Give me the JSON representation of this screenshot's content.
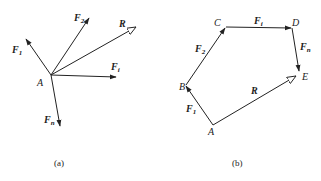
{
  "panel_a": {
    "caption": "(a)",
    "origin_label": "A",
    "vectors": [
      {
        "name": "F",
        "sub": "1",
        "arrow": "solid"
      },
      {
        "name": "F",
        "sub": "2",
        "arrow": "solid"
      },
      {
        "name": "R",
        "sub": "",
        "arrow": "hollow"
      },
      {
        "name": "F",
        "sub": "i",
        "arrow": "solid"
      },
      {
        "name": "F",
        "sub": "n",
        "arrow": "solid"
      }
    ]
  },
  "panel_b": {
    "caption": "(b)",
    "points": [
      "A",
      "B",
      "C",
      "D",
      "E"
    ],
    "vectors": [
      {
        "name": "F",
        "sub": "1",
        "from": "A",
        "to": "B",
        "arrow": "solid"
      },
      {
        "name": "F",
        "sub": "2",
        "from": "B",
        "to": "C",
        "arrow": "solid"
      },
      {
        "name": "F",
        "sub": "i",
        "from": "C",
        "to": "D",
        "arrow": "solid"
      },
      {
        "name": "F",
        "sub": "n",
        "from": "D",
        "to": "E",
        "arrow": "solid"
      },
      {
        "name": "R",
        "sub": "",
        "from": "A",
        "to": "E",
        "arrow": "hollow"
      }
    ]
  }
}
